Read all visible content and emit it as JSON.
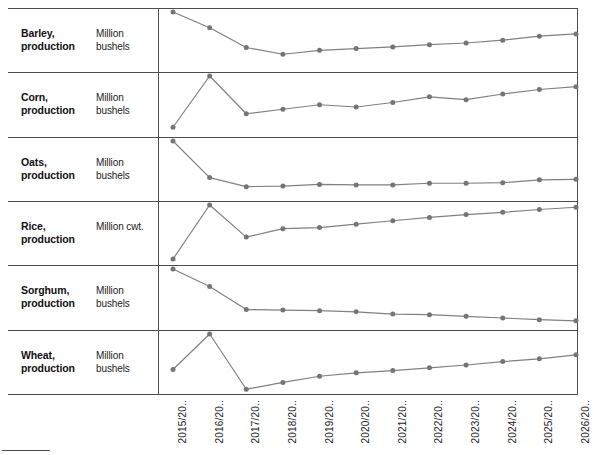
{
  "chart_data": {
    "type": "line",
    "title": "",
    "subtitle": "",
    "xlabel": "",
    "ylabel": "",
    "legend_position": "none",
    "grid": false,
    "layout": "small-multiples, 6 stacked panels sharing one x-axis",
    "x": [
      "2015/20..",
      "2016/20..",
      "2017/20..",
      "2018/20..",
      "2019/20..",
      "2020/20..",
      "2021/20..",
      "2022/20..",
      "2023/20..",
      "2024/20..",
      "2025/20..",
      "2026/20.."
    ],
    "series": [
      {
        "name": "Barley, production",
        "unit": "Million bushels",
        "values": [
          100,
          72,
          37,
          25,
          32,
          35,
          38,
          42,
          45,
          50,
          57,
          61
        ],
        "ylim": [
          0,
          100
        ]
      },
      {
        "name": "Corn, production",
        "unit": "Million bushels",
        "values": [
          9,
          100,
          33,
          41,
          49,
          45,
          53,
          63,
          58,
          68,
          76,
          81
        ],
        "ylim": [
          0,
          100
        ]
      },
      {
        "name": "Oats, production",
        "unit": "Million bushels",
        "values": [
          100,
          35,
          19,
          20,
          23,
          22,
          22,
          25,
          25,
          26,
          31,
          32
        ],
        "ylim": [
          0,
          100
        ]
      },
      {
        "name": "Rice, production",
        "unit": "Million cwt.",
        "values": [
          4,
          100,
          43,
          58,
          60,
          66,
          72,
          78,
          83,
          87,
          92,
          96
        ],
        "ylim": [
          0,
          100
        ]
      },
      {
        "name": "Sorghum, production",
        "unit": "Million bushels",
        "values": [
          100,
          69,
          28,
          27,
          26,
          24,
          20,
          19,
          16,
          13,
          10,
          8
        ],
        "ylim": [
          0,
          100
        ]
      },
      {
        "name": "Wheat, production",
        "unit": "Million bushels",
        "values": [
          37,
          100,
          2,
          14,
          25,
          31,
          35,
          40,
          45,
          51,
          56,
          63
        ],
        "ylim": [
          0,
          100
        ]
      }
    ],
    "marker": "circle",
    "line_color": "#808080",
    "marker_color": "#757575"
  },
  "panels": [
    {
      "name_line1": "Barley,",
      "name_line2": "production",
      "name": "Barley,\nproduction",
      "unit": "Million\nbushels"
    },
    {
      "name_line1": "Corn,",
      "name_line2": "production",
      "name": "Corn,\nproduction",
      "unit": "Million\nbushels"
    },
    {
      "name_line1": "Oats,",
      "name_line2": "production",
      "name": "Oats,\nproduction",
      "unit": "Million\nbushels"
    },
    {
      "name_line1": "Rice,",
      "name_line2": "production",
      "name": "Rice,\nproduction",
      "unit": "Million cwt."
    },
    {
      "name_line1": "Sorghum,",
      "name_line2": "production",
      "name": "Sorghum,\nproduction",
      "unit": "Million\nbushels"
    },
    {
      "name_line1": "Wheat,",
      "name_line2": "production",
      "name": "Wheat,\nproduction",
      "unit": "Million\nbushels"
    }
  ],
  "axis": {
    "ticks": [
      "2015/20..",
      "2016/20..",
      "2017/20..",
      "2018/20..",
      "2019/20..",
      "2020/20..",
      "2021/20..",
      "2022/20..",
      "2023/20..",
      "2024/20..",
      "2025/20..",
      "2026/20.."
    ]
  },
  "colors": {
    "line": "#808080",
    "marker": "#757575",
    "frame": "#4d4d4d",
    "text": "#1a1a1a",
    "background": "#ffffff"
  }
}
